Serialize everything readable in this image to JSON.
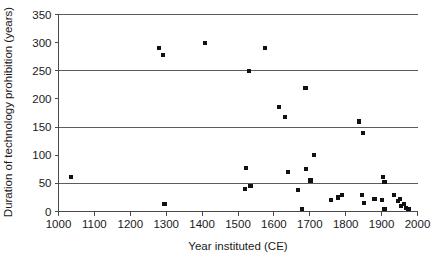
{
  "chart_data": {
    "type": "scatter",
    "title": "",
    "xlabel": "Year instituted (CE)",
    "ylabel": "Duration of technology prohibition (years)",
    "xlim": [
      1000,
      2000
    ],
    "ylim": [
      0,
      350
    ],
    "xticks": [
      1000,
      1100,
      1200,
      1300,
      1400,
      1500,
      1600,
      1700,
      1800,
      1900,
      2000
    ],
    "yticks": [
      0,
      50,
      100,
      150,
      200,
      250,
      300,
      350
    ],
    "xtick_labels": [
      "1000",
      "1100",
      "1200",
      "1300",
      "1400",
      "1500",
      "1600",
      "1700",
      "1800",
      "1900",
      "2000"
    ],
    "ytick_labels": [
      "0",
      "50",
      "100",
      "150",
      "200",
      "250",
      "300",
      "350"
    ],
    "grid": "horizontal-major",
    "gridlines_y": [
      50,
      150,
      250,
      350
    ],
    "legend": "none",
    "marker": "square",
    "marker_color": "#111111",
    "points": [
      {
        "x": 1035,
        "y": 62
      },
      {
        "x": 1295,
        "y": 14
      },
      {
        "x": 1280,
        "y": 290
      },
      {
        "x": 1292,
        "y": 278
      },
      {
        "x": 1408,
        "y": 300
      },
      {
        "x": 1530,
        "y": 250
      },
      {
        "x": 1523,
        "y": 78
      },
      {
        "x": 1520,
        "y": 40
      },
      {
        "x": 1535,
        "y": 45
      },
      {
        "x": 1575,
        "y": 290
      },
      {
        "x": 1615,
        "y": 185
      },
      {
        "x": 1632,
        "y": 168
      },
      {
        "x": 1640,
        "y": 70
      },
      {
        "x": 1668,
        "y": 38
      },
      {
        "x": 1678,
        "y": 5
      },
      {
        "x": 1688,
        "y": 220
      },
      {
        "x": 1690,
        "y": 75
      },
      {
        "x": 1702,
        "y": 55
      },
      {
        "x": 1712,
        "y": 100
      },
      {
        "x": 1760,
        "y": 20
      },
      {
        "x": 1778,
        "y": 25
      },
      {
        "x": 1790,
        "y": 30
      },
      {
        "x": 1838,
        "y": 160
      },
      {
        "x": 1845,
        "y": 30
      },
      {
        "x": 1848,
        "y": 140
      },
      {
        "x": 1850,
        "y": 15
      },
      {
        "x": 1880,
        "y": 22
      },
      {
        "x": 1900,
        "y": 20
      },
      {
        "x": 1905,
        "y": 62
      },
      {
        "x": 1908,
        "y": 52
      },
      {
        "x": 1908,
        "y": 5
      },
      {
        "x": 1935,
        "y": 30
      },
      {
        "x": 1945,
        "y": 18
      },
      {
        "x": 1952,
        "y": 22
      },
      {
        "x": 1955,
        "y": 10
      },
      {
        "x": 1962,
        "y": 14
      },
      {
        "x": 1968,
        "y": 6
      },
      {
        "x": 1975,
        "y": 5
      }
    ]
  }
}
